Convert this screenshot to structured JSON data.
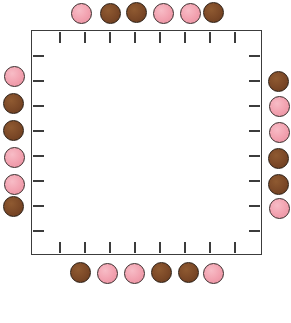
{
  "board": {
    "name": "token-border-board",
    "background_color": "#ffffff",
    "frame": {
      "border_color": "#3c3c3c",
      "fill_color": "#ffffff",
      "x": 31,
      "y": 30,
      "width": 231,
      "height": 225
    },
    "colors": {
      "pink": "#f2a2b0",
      "brown": "#7b4827",
      "outline": "#2e2522",
      "tick": "#3c3c3c"
    },
    "ticks": {
      "count_per_side": 8,
      "length": 11,
      "top": [
        59,
        84,
        109,
        134,
        159,
        184,
        209,
        234
      ],
      "bottom": [
        59,
        84,
        109,
        134,
        159,
        184,
        209,
        234
      ],
      "left": [
        55,
        80,
        105,
        130,
        155,
        180,
        205,
        230
      ],
      "right": [
        55,
        80,
        105,
        130,
        155,
        180,
        205,
        230
      ]
    },
    "token_size": 21,
    "sides": {
      "top": {
        "label": "top-row",
        "tokens": [
          {
            "color": "pink",
            "x": 71,
            "y": 3
          },
          {
            "color": "brown",
            "x": 100,
            "y": 3
          },
          {
            "color": "brown",
            "x": 126,
            "y": 2
          },
          {
            "color": "pink",
            "x": 153,
            "y": 3
          },
          {
            "color": "pink",
            "x": 180,
            "y": 3
          },
          {
            "color": "brown",
            "x": 203,
            "y": 2
          }
        ]
      },
      "bottom": {
        "label": "bottom-row",
        "tokens": [
          {
            "color": "brown",
            "x": 70,
            "y": 262
          },
          {
            "color": "pink",
            "x": 97,
            "y": 263
          },
          {
            "color": "pink",
            "x": 124,
            "y": 263
          },
          {
            "color": "brown",
            "x": 151,
            "y": 262
          },
          {
            "color": "brown",
            "x": 178,
            "y": 262
          },
          {
            "color": "pink",
            "x": 203,
            "y": 263
          }
        ]
      },
      "left": {
        "label": "left-column",
        "tokens": [
          {
            "color": "pink",
            "x": 4,
            "y": 66
          },
          {
            "color": "brown",
            "x": 3,
            "y": 93
          },
          {
            "color": "brown",
            "x": 3,
            "y": 120
          },
          {
            "color": "pink",
            "x": 4,
            "y": 147
          },
          {
            "color": "pink",
            "x": 4,
            "y": 174
          },
          {
            "color": "brown",
            "x": 3,
            "y": 196
          }
        ]
      },
      "right": {
        "label": "right-column",
        "tokens": [
          {
            "color": "brown",
            "x": 268,
            "y": 71
          },
          {
            "color": "pink",
            "x": 269,
            "y": 96
          },
          {
            "color": "pink",
            "x": 269,
            "y": 122
          },
          {
            "color": "brown",
            "x": 268,
            "y": 148
          },
          {
            "color": "brown",
            "x": 268,
            "y": 174
          },
          {
            "color": "pink",
            "x": 269,
            "y": 198
          }
        ]
      }
    }
  }
}
